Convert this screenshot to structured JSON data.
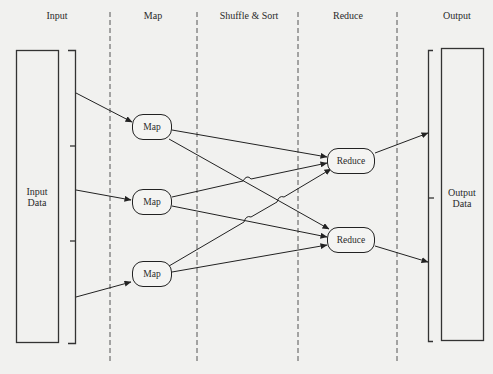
{
  "columns": [
    {
      "id": "input",
      "label": "Input",
      "x": 57
    },
    {
      "id": "map",
      "label": "Map",
      "x": 153
    },
    {
      "id": "shuffle",
      "label": "Shuffle & Sort",
      "x": 249
    },
    {
      "id": "reduce",
      "label": "Reduce",
      "x": 348
    },
    {
      "id": "output",
      "label": "Output",
      "x": 457
    }
  ],
  "input_data": {
    "label": "Input\nData"
  },
  "output_data": {
    "label": "Output\nData"
  },
  "map_nodes": [
    {
      "label": "Map"
    },
    {
      "label": "Map"
    },
    {
      "label": "Map"
    }
  ],
  "reduce_nodes": [
    {
      "label": "Reduce"
    },
    {
      "label": "Reduce"
    }
  ],
  "colors": {
    "background": "#f1f1ef",
    "stroke": "#222222",
    "divider": "#555555"
  }
}
